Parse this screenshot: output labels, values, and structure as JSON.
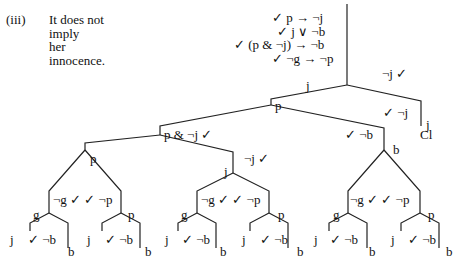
{
  "caption": {
    "number": "(iii)",
    "lines": [
      "It does not",
      "imply",
      "her",
      "innocence."
    ]
  },
  "premises": [
    "✓ p → ¬j",
    "✓ j ∨ ¬b",
    "✓ (p & ¬j) → ¬b",
    "✓ ¬g → ¬p"
  ],
  "labels": {
    "root_left": "j",
    "root_right": "¬j ✓",
    "n1": "p",
    "n1_right": "✓ ¬j",
    "n1_right_leaf": "j",
    "closed": "Cl",
    "n2": "p & ¬j ✓",
    "n2_right": "✓ ¬b",
    "n3_right": "¬j ✓",
    "n3_right_leaf": "j",
    "n2r_leaf": "b",
    "subtrees": [
      {
        "top": "p",
        "split": "¬g ✓  ✓ ¬p",
        "left": "g",
        "right": "p",
        "ll": "j",
        "mid": "✓ ¬b",
        "rr": "b"
      },
      {
        "top": "j",
        "split": "¬g ✓  ✓ ¬p",
        "left": "g",
        "right": "p",
        "ll": "j",
        "mid": "✓ ¬b",
        "rr": "b"
      },
      {
        "top": "b",
        "split": "¬g ✓  ✓ ¬p",
        "left": "g",
        "right": "p",
        "ll": "j",
        "mid": "✓ ¬b",
        "rr": "b"
      }
    ]
  }
}
